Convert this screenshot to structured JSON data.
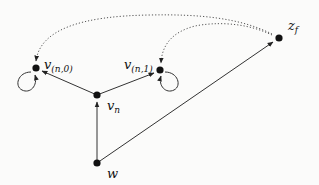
{
  "diagram": {
    "nodes": [
      {
        "id": "v_n0",
        "label": "v",
        "sub": "(n,0)",
        "x": 36,
        "y": 68,
        "self_loop": "left"
      },
      {
        "id": "v_n1",
        "label": "v",
        "sub": "(n,1)",
        "x": 160,
        "y": 70,
        "self_loop": "right"
      },
      {
        "id": "v_n",
        "label": "v",
        "sub": "n",
        "x": 97,
        "y": 95
      },
      {
        "id": "w",
        "label": "w",
        "sub": "",
        "x": 97,
        "y": 163
      },
      {
        "id": "z_f",
        "label": "z",
        "sub": "f",
        "x": 279,
        "y": 38
      }
    ],
    "edges": [
      {
        "from": "v_n",
        "to": "v_n0",
        "style": "solid"
      },
      {
        "from": "v_n",
        "to": "v_n1",
        "style": "solid"
      },
      {
        "from": "w",
        "to": "v_n",
        "style": "solid"
      },
      {
        "from": "w",
        "to": "z_f",
        "style": "solid"
      },
      {
        "from": "z_f",
        "to": "v_n0",
        "style": "dotted"
      },
      {
        "from": "z_f",
        "to": "v_n1",
        "style": "dotted"
      },
      {
        "from": "v_n0",
        "to": "v_n0",
        "style": "self-loop"
      },
      {
        "from": "v_n1",
        "to": "v_n1",
        "style": "self-loop"
      }
    ],
    "colors": {
      "node": "#111111",
      "edge": "#333333",
      "background": "#fbfbfa"
    }
  },
  "labels": {
    "v_n0": {
      "main": "v",
      "sub": "(n,0)"
    },
    "v_n1": {
      "main": "v",
      "sub": "(n,1)"
    },
    "v_n": {
      "main": "v",
      "sub": "n"
    },
    "w": {
      "main": "w"
    },
    "z_f": {
      "main": "z",
      "sub": "f"
    }
  }
}
